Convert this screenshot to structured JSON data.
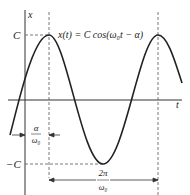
{
  "diagram": {
    "equation": "x(t) = C cos(ω₀t − α)",
    "y_axis_label": "x",
    "x_axis_label": "t",
    "amplitude_top_label": "C",
    "amplitude_bottom_label": "−C",
    "phase_shift_label_num": "α",
    "phase_shift_label_den": "ω₀",
    "period_label_num": "2π",
    "period_label_den": "ω₀",
    "line_color": "#222222"
  }
}
